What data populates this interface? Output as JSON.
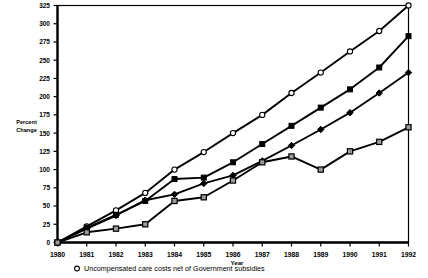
{
  "chart_data": {
    "type": "line",
    "title": "",
    "xlabel": "Year",
    "ylabel": "Percent Change",
    "x": [
      1980,
      1981,
      1982,
      1983,
      1984,
      1985,
      1986,
      1987,
      1988,
      1989,
      1990,
      1991,
      1992
    ],
    "xlim": [
      1980,
      1992
    ],
    "ylim": [
      0,
      325
    ],
    "ytick_step": 25,
    "yticks": [
      0,
      25,
      50,
      75,
      100,
      125,
      150,
      175,
      200,
      225,
      250,
      275,
      300,
      325
    ],
    "xticks": [
      "1980",
      "1981",
      "1982",
      "1983",
      "1984",
      "1985",
      "1986",
      "1987",
      "1988",
      "1989",
      "1990",
      "1991",
      "1992"
    ],
    "grid": false,
    "legend_position": "below-axis-left",
    "series": [
      {
        "name": "Uncompensated care costs net of Government subsidies",
        "marker": "open-circle",
        "values": [
          0,
          22,
          44,
          68,
          100,
          124,
          150,
          175,
          205,
          233,
          262,
          290,
          325
        ]
      },
      {
        "name": "series-2",
        "marker": "filled-square",
        "values": [
          0,
          20,
          38,
          57,
          87,
          89,
          110,
          135,
          160,
          185,
          210,
          240,
          283
        ]
      },
      {
        "name": "series-3",
        "marker": "filled-diamond",
        "values": [
          0,
          19,
          37,
          58,
          66,
          81,
          92,
          112,
          133,
          155,
          178,
          205,
          233
        ]
      },
      {
        "name": "series-4",
        "marker": "open-square",
        "values": [
          0,
          14,
          19,
          25,
          57,
          62,
          85,
          110,
          118,
          100,
          125,
          138,
          158
        ]
      }
    ]
  },
  "legend": {
    "entries": [
      {
        "marker": "open-circle",
        "label": "Uncompensated care costs net of Government subsidies"
      }
    ]
  }
}
